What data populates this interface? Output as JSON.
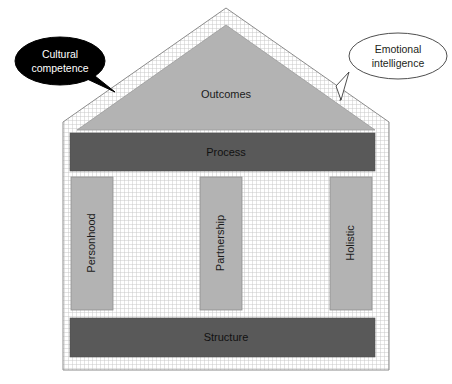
{
  "diagram": {
    "roof": {
      "label": "Outcomes",
      "fill": "#b3b3b3"
    },
    "bands": [
      {
        "name": "process",
        "label": "Process",
        "fill": "#595959"
      },
      {
        "name": "structure",
        "label": "Structure",
        "fill": "#595959"
      }
    ],
    "columns": [
      {
        "name": "personhood",
        "label": "Personhood",
        "fill": "#b3b3b3"
      },
      {
        "name": "partnership",
        "label": "Partnership",
        "fill": "#b3b3b3"
      },
      {
        "name": "holistic",
        "label": "Holistic",
        "fill": "#b3b3b3"
      }
    ],
    "callouts": [
      {
        "name": "cultural-competence",
        "line1": "Cultural",
        "line2": "competence",
        "style": "filled-dark",
        "fill": "#000000",
        "text_color": "#ffffff"
      },
      {
        "name": "emotional-intelligence",
        "line1": "Emotional",
        "line2": "intelligence",
        "style": "outline-light",
        "fill": "#ffffff",
        "text_color": "#231f20"
      }
    ],
    "walls": {
      "pattern": "fine-grid-hatch",
      "grid_color": "#c8c8c8",
      "background": "#ffffff"
    },
    "outline_color": "#7f7f7f"
  }
}
